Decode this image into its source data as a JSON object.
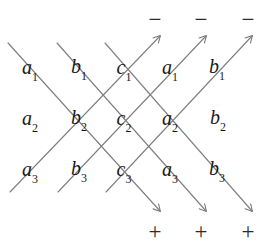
{
  "figure": {
    "background_color": "#ffffff",
    "line_color": "#808080",
    "text_color": "#1a1a1a",
    "width": 273,
    "height": 249
  },
  "matrix": {
    "rows": [
      [
        {
          "base": "a",
          "sub": "1",
          "x": 30,
          "y": 69
        },
        {
          "base": "b",
          "sub": "1",
          "x": 79,
          "y": 68
        },
        {
          "base": "c",
          "sub": "1",
          "x": 124,
          "y": 69
        },
        {
          "base": "a",
          "sub": "1",
          "x": 170,
          "y": 69
        },
        {
          "base": "b",
          "sub": "1",
          "x": 217,
          "y": 68
        }
      ],
      [
        {
          "base": "a",
          "sub": "2",
          "x": 30,
          "y": 120
        },
        {
          "base": "b",
          "sub": "2",
          "x": 79,
          "y": 119
        },
        {
          "base": "c",
          "sub": "2",
          "x": 124,
          "y": 120
        },
        {
          "base": "a",
          "sub": "2",
          "x": 170,
          "y": 120
        },
        {
          "base": "b",
          "sub": "2",
          "x": 218,
          "y": 119
        }
      ],
      [
        {
          "base": "a",
          "sub": "3",
          "x": 30,
          "y": 171
        },
        {
          "base": "b",
          "sub": "3",
          "x": 79,
          "y": 170
        },
        {
          "base": "c",
          "sub": "3",
          "x": 124,
          "y": 171
        },
        {
          "base": "a",
          "sub": "3",
          "x": 170,
          "y": 171
        },
        {
          "base": "b",
          "sub": "3",
          "x": 217,
          "y": 170
        }
      ]
    ]
  },
  "signs": {
    "negative": [
      {
        "symbol": "−",
        "x": 155,
        "y": 19
      },
      {
        "symbol": "−",
        "x": 201,
        "y": 19
      },
      {
        "symbol": "−",
        "x": 248,
        "y": 19
      }
    ],
    "positive": [
      {
        "symbol": "+",
        "x": 155,
        "y": 231
      },
      {
        "symbol": "+",
        "x": 201,
        "y": 231
      },
      {
        "symbol": "+",
        "x": 248,
        "y": 231
      }
    ]
  },
  "diagonals": {
    "down_right": [
      {
        "x1": 8,
        "y1": 43,
        "x2": 160,
        "y2": 211
      },
      {
        "x1": 57,
        "y1": 43,
        "x2": 206,
        "y2": 211
      },
      {
        "x1": 105,
        "y1": 43,
        "x2": 252,
        "y2": 211
      }
    ],
    "up_right": [
      {
        "x1": 10,
        "y1": 192,
        "x2": 160,
        "y2": 36
      },
      {
        "x1": 58,
        "y1": 192,
        "x2": 206,
        "y2": 36
      },
      {
        "x1": 106,
        "y1": 192,
        "x2": 252,
        "y2": 36
      }
    ]
  }
}
